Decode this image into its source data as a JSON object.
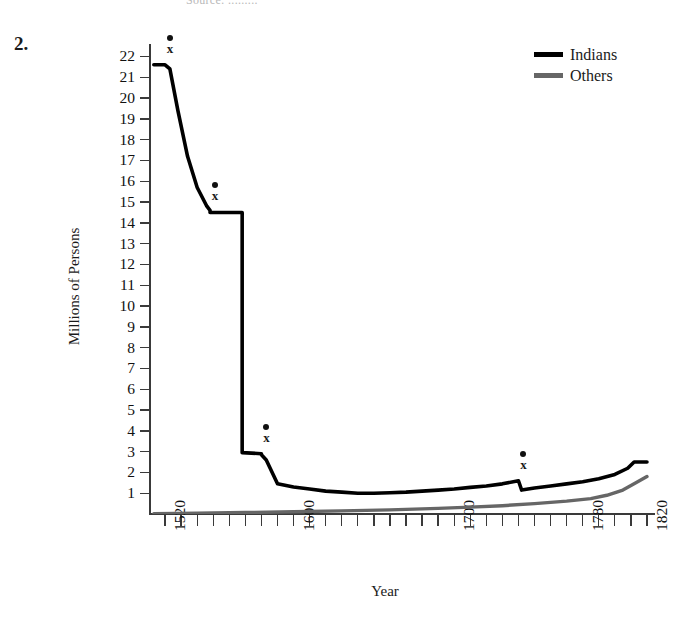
{
  "page": {
    "item_number": "2.",
    "top_remnant": "Source: ........."
  },
  "legend": {
    "position": "top-right",
    "entries": [
      {
        "label": "Indians",
        "color": "#000000"
      },
      {
        "label": "Others",
        "color": "#666666"
      }
    ]
  },
  "markers": [
    {
      "label": "x",
      "year": 1520,
      "value": 21.6
    },
    {
      "label": "x",
      "year": 1548,
      "value": 14.5
    },
    {
      "label": "x",
      "year": 1580,
      "value": 2.9
    },
    {
      "label": "x",
      "year": 1740,
      "value": 1.6
    }
  ],
  "chart_data": {
    "type": "line",
    "title": "",
    "xlabel": "Year",
    "ylabel": "Millions of Persons",
    "xlim": [
      1510,
      1825
    ],
    "ylim": [
      0,
      22.6
    ],
    "grid": false,
    "legend_position": "top-right",
    "xticks_major": [
      1520,
      1600,
      1700,
      1780,
      1820
    ],
    "xtick_labels": [
      "1520",
      "1600",
      "1700",
      "1780",
      "1820"
    ],
    "xtick_step_minor": 10,
    "yticks": [
      1,
      2,
      3,
      4,
      5,
      6,
      7,
      8,
      9,
      10,
      11,
      12,
      13,
      14,
      15,
      16,
      17,
      18,
      19,
      20,
      21,
      22
    ],
    "ytick_labels": [
      "1",
      "2",
      "3",
      "4",
      "5",
      "6",
      "7",
      "8",
      "9",
      "10",
      "11",
      "12",
      "13",
      "14",
      "15",
      "16",
      "17",
      "18",
      "19",
      "20",
      "21",
      "22"
    ],
    "annotations": [
      {
        "text": "x",
        "x": 1520,
        "y": 21.6
      },
      {
        "text": "x",
        "x": 1548,
        "y": 14.5
      },
      {
        "text": "x",
        "x": 1580,
        "y": 2.9
      },
      {
        "text": "x",
        "x": 1740,
        "y": 1.6
      }
    ],
    "series": [
      {
        "name": "Indians",
        "color": "#000000",
        "x": [
          1513,
          1520,
          1523,
          1528,
          1534,
          1540,
          1546,
          1548,
          1548,
          1565,
          1568,
          1568,
          1580,
          1580,
          1583,
          1590,
          1600,
          1610,
          1620,
          1630,
          1640,
          1650,
          1660,
          1670,
          1680,
          1690,
          1700,
          1710,
          1720,
          1730,
          1740,
          1740,
          1742,
          1750,
          1760,
          1770,
          1780,
          1790,
          1800,
          1808,
          1812,
          1820
        ],
        "y": [
          21.6,
          21.6,
          21.4,
          19.4,
          17.2,
          15.7,
          14.8,
          14.6,
          14.5,
          14.5,
          14.5,
          2.95,
          2.9,
          2.85,
          2.6,
          1.45,
          1.3,
          1.2,
          1.1,
          1.05,
          1.0,
          1.0,
          1.02,
          1.05,
          1.1,
          1.15,
          1.2,
          1.28,
          1.35,
          1.45,
          1.6,
          1.6,
          1.15,
          1.25,
          1.35,
          1.45,
          1.55,
          1.7,
          1.9,
          2.2,
          2.5,
          2.5
        ]
      },
      {
        "name": "Others",
        "color": "#666666",
        "x": [
          1513,
          1540,
          1570,
          1600,
          1630,
          1660,
          1690,
          1710,
          1730,
          1750,
          1770,
          1785,
          1795,
          1805,
          1812,
          1820
        ],
        "y": [
          0.02,
          0.04,
          0.07,
          0.11,
          0.15,
          0.2,
          0.27,
          0.33,
          0.4,
          0.5,
          0.62,
          0.74,
          0.9,
          1.15,
          1.45,
          1.8
        ]
      }
    ]
  }
}
